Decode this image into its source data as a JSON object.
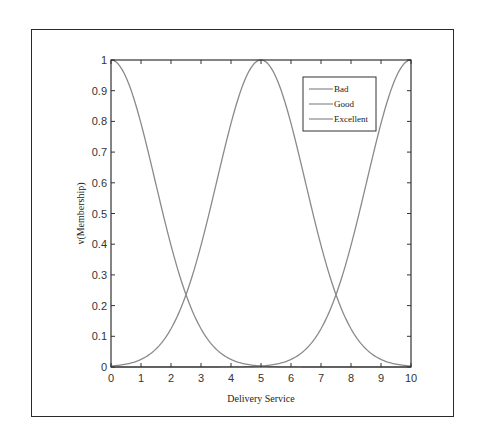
{
  "chart_data": {
    "type": "line",
    "title": "",
    "xlabel": "Delivery Service",
    "ylabel": "v(Membership)",
    "xlim": [
      0,
      10
    ],
    "ylim": [
      0,
      1
    ],
    "xticks": [
      0,
      1,
      2,
      3,
      4,
      5,
      6,
      7,
      8,
      9,
      10
    ],
    "yticks": [
      0,
      0.1,
      0.2,
      0.3,
      0.4,
      0.5,
      0.6,
      0.7,
      0.8,
      0.9,
      1
    ],
    "ytick_labels": [
      "0",
      "0.1",
      "0.2",
      "0.3",
      "0.4",
      "0.5",
      "0.6",
      "0.7",
      "0.8",
      "0.9",
      "1"
    ],
    "xtick_labels": [
      "0",
      "1",
      "2",
      "3",
      "4",
      "5",
      "6",
      "7",
      "8",
      "9",
      "10"
    ],
    "grid": false,
    "legend_position": "upper right (inside)",
    "x": [
      0,
      0.5,
      1,
      1.5,
      2,
      2.5,
      3,
      3.5,
      4,
      4.5,
      5,
      5.5,
      6,
      6.5,
      7,
      7.5,
      8,
      8.5,
      9,
      9.5,
      10
    ],
    "series": [
      {
        "name": "Bad",
        "shape": "gaussian",
        "center": 0,
        "sigma": 1.47,
        "values": [
          1.0,
          0.94,
          0.79,
          0.59,
          0.4,
          0.24,
          0.12,
          0.06,
          0.02,
          0.01,
          0.003,
          0.001,
          0.0,
          0.0,
          0.0,
          0.0,
          0.0,
          0.0,
          0.0,
          0.0,
          0.0
        ]
      },
      {
        "name": "Good",
        "shape": "gaussian",
        "center": 5,
        "sigma": 1.47,
        "values": [
          0.003,
          0.01,
          0.02,
          0.06,
          0.12,
          0.24,
          0.4,
          0.59,
          0.79,
          0.94,
          1.0,
          0.94,
          0.79,
          0.59,
          0.4,
          0.24,
          0.12,
          0.06,
          0.02,
          0.01,
          0.003
        ]
      },
      {
        "name": "Excellent",
        "shape": "gaussian",
        "center": 10,
        "sigma": 1.47,
        "values": [
          0.0,
          0.0,
          0.0,
          0.0,
          0.0,
          0.0,
          0.0,
          0.0,
          0.0,
          0.001,
          0.003,
          0.01,
          0.02,
          0.06,
          0.12,
          0.24,
          0.4,
          0.59,
          0.79,
          0.94,
          1.0
        ]
      }
    ],
    "annotations": [
      "Curves intersect at x≈2.5 and x≈7.5 with membership ≈0.25"
    ]
  },
  "style": {
    "line_color": "#8a8a8a",
    "axis_color": "#333333",
    "frame_color": "#2a2a2a"
  }
}
